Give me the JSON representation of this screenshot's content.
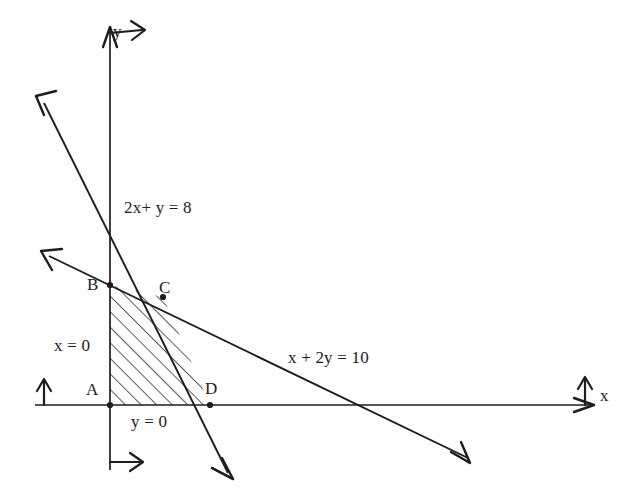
{
  "figure": {
    "type": "diagram",
    "background_color": "#fefefe",
    "ink_color": "#1d1d1d"
  },
  "axes": {
    "x_axis_label": "x",
    "y_axis_label": "y",
    "origin_px": [
      110,
      405
    ],
    "x_axis_y_px": 405,
    "y_axis_x_px": 110,
    "arrowheads": "double (directional pair at each axis end)"
  },
  "lines": [
    {
      "id": "line-2x-y-8",
      "label": "2x+ y = 8",
      "label_pos_px": [
        124,
        198
      ],
      "start_px": [
        40,
        100
      ],
      "end_px": [
        230,
        478
      ],
      "x_intercept_px": [
        110,
        210
      ],
      "arrow_start": true,
      "arrow_end": true
    },
    {
      "id": "line-x-2y-10",
      "label": "x + 2y = 10",
      "label_pos_px": [
        288,
        348
      ],
      "start_px": [
        45,
        255
      ],
      "end_px": [
        470,
        462
      ],
      "arrow_start": true,
      "arrow_end": true
    }
  ],
  "constraints": [
    {
      "id": "constraint-x-0",
      "label": "x = 0",
      "pos_px": [
        54,
        336
      ]
    },
    {
      "id": "constraint-y-0",
      "label": "y = 0",
      "pos_px": [
        131,
        412
      ]
    }
  ],
  "vertices": [
    {
      "id": "vertex-a",
      "label": "A",
      "point_px": [
        110,
        405
      ],
      "label_pos_px": [
        86,
        380
      ]
    },
    {
      "id": "vertex-b",
      "label": "B",
      "point_px": [
        110,
        285
      ],
      "label_pos_px": [
        87,
        275
      ]
    },
    {
      "id": "vertex-c",
      "label": "C",
      "point_px": [
        163,
        297
      ],
      "label_pos_px": [
        159,
        278
      ]
    },
    {
      "id": "vertex-d",
      "label": "D",
      "point_px": [
        210,
        405
      ],
      "label_pos_px": [
        205,
        379
      ]
    }
  ],
  "region": {
    "id": "feasible-region",
    "name": "ABCD",
    "fill": "diagonal-hatch",
    "polygon_px": [
      [
        110,
        405
      ],
      [
        110,
        285
      ],
      [
        163,
        297
      ],
      [
        210,
        405
      ]
    ]
  }
}
